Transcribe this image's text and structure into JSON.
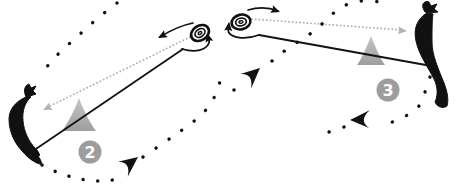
{
  "diagram": {
    "panels": [
      {
        "id": "mark-2",
        "badge_number": "2"
      },
      {
        "id": "mark-3",
        "badge_number": "3"
      }
    ],
    "colors": {
      "ink": "#111111",
      "gray-dotted": "#b3b3b3",
      "cone-top": "#c6c6c6",
      "cone-bottom": "#9e9e9e",
      "badge-bg": "#9d9d9d",
      "badge-text": "#ffffff",
      "background": "#ffffff"
    },
    "icons": {
      "buoy": "buoy-top-view-icon",
      "sailor": "windsurfer-silhouette",
      "cone": "cone-mark-icon",
      "course_arrow": "course-direction-arrow-icon",
      "rounding_arrow": "rounding-arrow-icon"
    }
  }
}
